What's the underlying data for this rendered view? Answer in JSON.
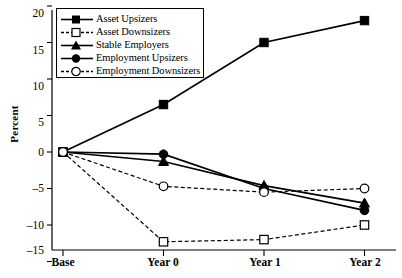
{
  "chart_data": {
    "type": "line",
    "title": "",
    "xlabel": "",
    "ylabel": "Percent",
    "categories": [
      "Base",
      "Year 0",
      "Year 1",
      "Year 2"
    ],
    "ylim": [
      -15,
      20
    ],
    "yticks": [
      20,
      15,
      10,
      5,
      0,
      -5,
      -10,
      -15
    ],
    "ytick_labels": [
      "20",
      "15",
      "10",
      "5",
      "0",
      "–5",
      "–10",
      "–15"
    ],
    "grid": false,
    "legend_position": "top-left-inside",
    "series": [
      {
        "name": "Asset Upsizers",
        "marker": "filled-square",
        "line": "solid",
        "color": "#000000",
        "values": [
          0,
          6.5,
          15.0,
          18.0
        ]
      },
      {
        "name": "Asset Downsizers",
        "marker": "open-square",
        "line": "dashed",
        "color": "#000000",
        "values": [
          0,
          -12.3,
          -12.0,
          -10.0
        ]
      },
      {
        "name": "Stable Employers",
        "marker": "filled-triangle",
        "line": "solid",
        "color": "#000000",
        "values": [
          0,
          -1.3,
          -4.6,
          -7.0
        ]
      },
      {
        "name": "Employment Upsizers",
        "marker": "filled-circle",
        "line": "solid",
        "color": "#000000",
        "values": [
          0,
          -0.3,
          -5.0,
          -8.0
        ]
      },
      {
        "name": "Employment Downsizers",
        "marker": "open-circle",
        "line": "dashed",
        "color": "#000000",
        "values": [
          0,
          -4.7,
          -5.5,
          -5.0
        ]
      }
    ]
  },
  "axis": {
    "y_label": "Percent",
    "y_tick_labels": [
      "20",
      "15",
      "10",
      "5",
      "0",
      "–5",
      "–10",
      "–15"
    ],
    "x_tick_labels": [
      "Base",
      "Year 0",
      "Year 1",
      "Year 2"
    ]
  },
  "legend": {
    "items": [
      {
        "label": "Asset Upsizers"
      },
      {
        "label": "Asset Downsizers"
      },
      {
        "label": "Stable Employers"
      },
      {
        "label": "Employment Upsizers"
      },
      {
        "label": "Employment Downsizers"
      }
    ]
  }
}
